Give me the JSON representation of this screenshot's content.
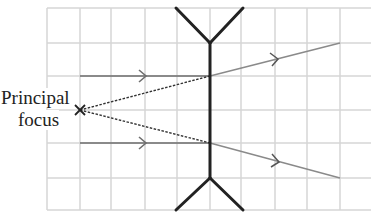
{
  "diagram": {
    "type": "ray-diagram",
    "labels": {
      "focus_line1": "Principal",
      "focus_line2": "focus"
    },
    "focus_marker": "×",
    "grid": {
      "x_lines": [
        47,
        80,
        111,
        145,
        177,
        210,
        241,
        275,
        307,
        340,
        371
      ],
      "y_lines": [
        8,
        43,
        76,
        110,
        143,
        178,
        210
      ],
      "color": "#d4d4d4"
    },
    "lens": {
      "x": 210,
      "top": 43,
      "bottom": 178,
      "color": "#222222"
    },
    "rays": {
      "incoming_color": "#777777",
      "outgoing_color": "#888888",
      "construction_color": "#333333"
    }
  }
}
